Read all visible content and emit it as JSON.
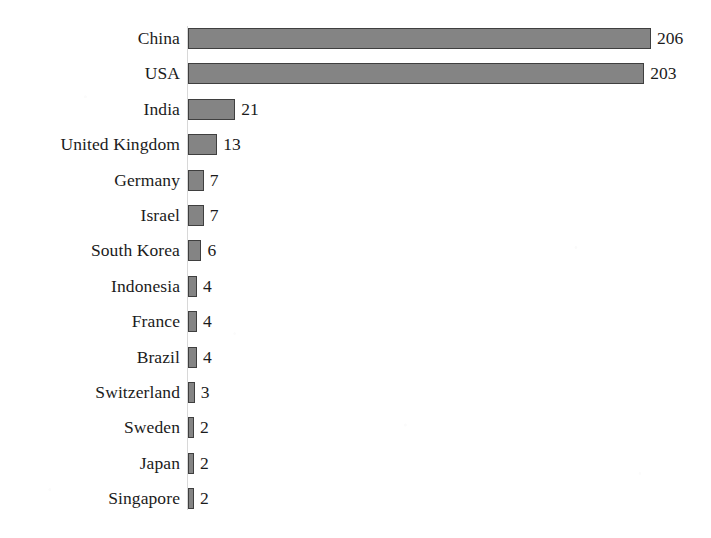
{
  "chart_data": {
    "type": "bar",
    "orientation": "horizontal",
    "title": "",
    "subtitle": "",
    "xlabel": "",
    "ylabel": "",
    "grid": false,
    "legend": null,
    "axis_visible": false,
    "tick_labels": [],
    "xlim": [
      0,
      206
    ],
    "value_labels_shown": true,
    "categories": [
      "China",
      "USA",
      "India",
      "United Kingdom",
      "Germany",
      "Israel",
      "South Korea",
      "Indonesia",
      "France",
      "Brazil",
      "Switzerland",
      "Sweden",
      "Japan",
      "Singapore"
    ],
    "values": [
      206,
      203,
      21,
      13,
      7,
      7,
      6,
      4,
      4,
      4,
      3,
      2,
      2,
      2
    ],
    "bars": [
      {
        "category": "China",
        "value": 206,
        "value_label": "206"
      },
      {
        "category": "USA",
        "value": 203,
        "value_label": "203"
      },
      {
        "category": "India",
        "value": 21,
        "value_label": "21"
      },
      {
        "category": "United Kingdom",
        "value": 13,
        "value_label": "13"
      },
      {
        "category": "Germany",
        "value": 7,
        "value_label": "7"
      },
      {
        "category": "Israel",
        "value": 7,
        "value_label": "7"
      },
      {
        "category": "South Korea",
        "value": 6,
        "value_label": "6"
      },
      {
        "category": "Indonesia",
        "value": 4,
        "value_label": "4"
      },
      {
        "category": "France",
        "value": 4,
        "value_label": "4"
      },
      {
        "category": "Brazil",
        "value": 4,
        "value_label": "4"
      },
      {
        "category": "Switzerland",
        "value": 3,
        "value_label": "3"
      },
      {
        "category": "Sweden",
        "value": 2,
        "value_label": "2"
      },
      {
        "category": "Japan",
        "value": 2,
        "value_label": "2"
      },
      {
        "category": "Singapore",
        "value": 2,
        "value_label": "2"
      }
    ]
  },
  "style": {
    "bar_fill": "#848484",
    "bar_border": "#3f3f3f",
    "text_color": "#1b1b1b",
    "background": "#ffffff",
    "axis_color": "#d8d8d8"
  },
  "geometry": {
    "bar_origin_x": 188,
    "label_right_x": 180,
    "first_row_top": 28,
    "row_pitch": 35.4,
    "bar_height": 21,
    "px_per_unit": 2.248,
    "min_bar_width": 6,
    "value_gap": 6
  }
}
